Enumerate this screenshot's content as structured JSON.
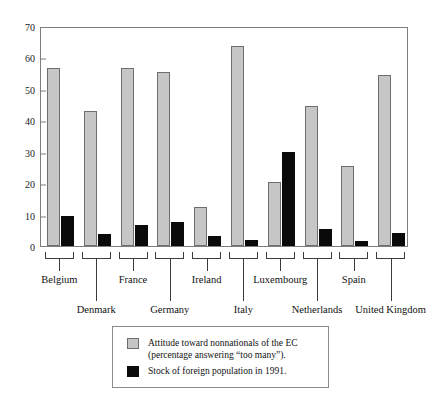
{
  "chart_data": {
    "type": "bar",
    "title": "",
    "xlabel": "",
    "ylabel": "",
    "ylim": [
      0,
      70
    ],
    "yticks": [
      0,
      10,
      20,
      30,
      40,
      50,
      60,
      70
    ],
    "grid": false,
    "legend_position": "below-plot",
    "categories": [
      "Belgium",
      "Denmark",
      "France",
      "Germany",
      "Ireland",
      "Italy",
      "Luxembourg",
      "Netherlands",
      "Spain",
      "United Kingdom"
    ],
    "series": [
      {
        "name": "Attitude toward nonnationals of the EC (percentage answering “too many”).",
        "color": "#c6c6c6",
        "values": [
          56.5,
          43.0,
          56.5,
          55.5,
          12.3,
          63.5,
          20.5,
          44.5,
          25.5,
          54.5
        ]
      },
      {
        "name": "Stock of foreign population in 1991.",
        "color": "#0a0a0a",
        "values": [
          9.5,
          3.8,
          6.8,
          7.8,
          3.2,
          2.0,
          30.0,
          5.5,
          1.5,
          4.0
        ]
      }
    ]
  },
  "legend": {
    "entries": [
      {
        "swatch": "gray",
        "line1": "Attitude toward nonnationals of the EC",
        "line2": "(percentage answering “too many”)."
      },
      {
        "swatch": "black",
        "line1": "Stock of foreign population in 1991.",
        "line2": ""
      }
    ]
  },
  "colors": {
    "series_gray": "#c6c6c6",
    "series_black": "#0a0a0a",
    "axis": "#7d7d7d",
    "text": "#111111",
    "background": "#ffffff"
  }
}
